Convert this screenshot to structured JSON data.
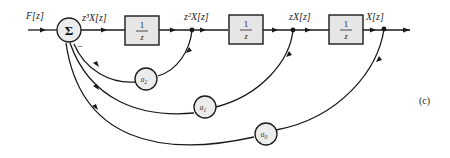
{
  "diagram": {
    "input_label": "F[z]",
    "summer_symbol": "Σ",
    "summer_sign": "−",
    "signals": {
      "s3": "z³X[z]",
      "s2": "z²X[z]",
      "s1": "zX[z]",
      "s0": "X[z]"
    },
    "delay_blocks": [
      {
        "num": "1",
        "den": "z"
      },
      {
        "num": "1",
        "den": "z"
      },
      {
        "num": "1",
        "den": "z"
      }
    ],
    "gains": [
      {
        "label": "a",
        "sub": "2"
      },
      {
        "label": "a",
        "sub": "1"
      },
      {
        "label": "a",
        "sub": "0"
      }
    ],
    "figure_tag": "(c)"
  }
}
